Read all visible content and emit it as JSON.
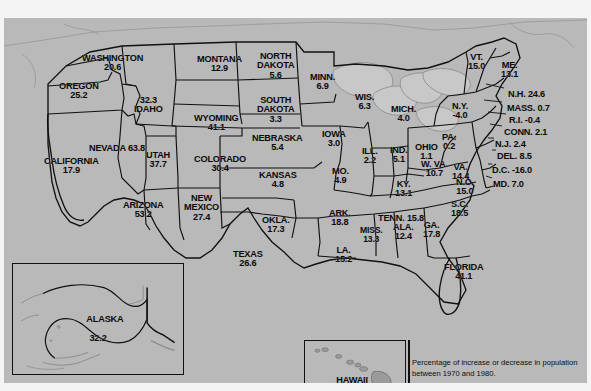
{
  "figure": {
    "kind": "choropleth-map",
    "region": "United States",
    "caption": "Percentage of increase or decrease in population between 1970 and 1980.",
    "background_color": "#b9b9b9",
    "land_color": "#b9b9b9",
    "water_color": "#c9c9c9",
    "border_color": "#111111",
    "text_color": "#0b0b0b"
  },
  "insets": {
    "alaska": {
      "name": "ALASKA",
      "value": "32.2"
    },
    "hawaii": {
      "name": "HAWAII",
      "value": "25.3"
    }
  },
  "chart_data": {
    "type": "map",
    "title": "",
    "subtitle": "Percentage of increase or decrease in population between 1970 and 1980.",
    "unit": "percent",
    "value_label": "Percent change in population, 1970-1980",
    "categories": [
      "WASHINGTON",
      "OREGON",
      "IDAHO",
      "MONTANA",
      "WYOMING",
      "NEVADA",
      "CALIFORNIA",
      "UTAH",
      "COLORADO",
      "ARIZONA",
      "NEW MEXICO",
      "NORTH DAKOTA",
      "SOUTH DAKOTA",
      "NEBRASKA",
      "KANSAS",
      "OKLA.",
      "TEXAS",
      "MINN.",
      "IOWA",
      "MO.",
      "ARK.",
      "LA.",
      "WIS.",
      "ILL.",
      "MISS.",
      "MICH.",
      "IND.",
      "OHIO",
      "KY.",
      "TENN.",
      "ALA.",
      "GA.",
      "FLORIDA",
      "S.C.",
      "N.C.",
      "VA.",
      "W. VA.",
      "MD.",
      "D.C.",
      "DEL.",
      "PA.",
      "N.J.",
      "N.Y.",
      "CONN.",
      "R.I.",
      "MASS.",
      "VT.",
      "N.H.",
      "ME.",
      "ALASKA",
      "HAWAII"
    ],
    "values": [
      20.6,
      25.2,
      32.3,
      12.9,
      41.1,
      63.8,
      17.9,
      37.7,
      30.4,
      53.2,
      27.4,
      5.6,
      3.3,
      5.4,
      4.8,
      17.3,
      26.6,
      6.9,
      3.0,
      4.9,
      18.8,
      15.2,
      6.3,
      2.2,
      13.3,
      4.0,
      5.1,
      1.1,
      13.1,
      15.8,
      12.4,
      17.8,
      41.1,
      18.5,
      15.0,
      14.4,
      10.7,
      7.0,
      -16.0,
      8.5,
      0.2,
      2.4,
      -4.0,
      2.1,
      -0.4,
      0.7,
      15.0,
      24.6,
      13.1,
      32.2,
      25.3
    ]
  },
  "states": [
    {
      "name": "WASHINGTON",
      "value": "20.6",
      "layout": "stack",
      "x": 78,
      "y": 36,
      "size": "s11"
    },
    {
      "name": "OREGON",
      "value": "25.2",
      "layout": "stack",
      "x": 55,
      "y": 64,
      "size": "s11"
    },
    {
      "name": "IDAHO",
      "value": "32.3",
      "layout": "value-above",
      "x": 130,
      "y": 78,
      "size": "s11"
    },
    {
      "name": "MONTANA",
      "value": "12.9",
      "layout": "stack",
      "x": 193,
      "y": 37,
      "size": "s11"
    },
    {
      "name": "WYOMING",
      "value": "41.1",
      "layout": "stack",
      "x": 190,
      "y": 96,
      "size": "s11"
    },
    {
      "name": "NEVADA",
      "value": "63.8",
      "layout": "inline-right",
      "x": 85,
      "y": 126,
      "size": "s11"
    },
    {
      "name": "CALIFORNIA",
      "value": "17.9",
      "layout": "stack",
      "x": 40,
      "y": 139,
      "size": "s11"
    },
    {
      "name": "UTAH",
      "value": "37.7",
      "layout": "stack",
      "x": 142,
      "y": 133,
      "size": "s11"
    },
    {
      "name": "COLORADO",
      "value": "30.4",
      "layout": "stack",
      "x": 190,
      "y": 137,
      "size": "s11"
    },
    {
      "name": "ARIZONA",
      "value": "53.2",
      "layout": "stack",
      "x": 119,
      "y": 183,
      "size": "s11"
    },
    {
      "name": "NEW\nMEXICO",
      "value": "27.4",
      "layout": "stack",
      "x": 180,
      "y": 176,
      "size": "s11"
    },
    {
      "name": "NORTH\nDAKOTA",
      "value": "5.6",
      "layout": "stack",
      "x": 253,
      "y": 34,
      "size": "s11"
    },
    {
      "name": "SOUTH\nDAKOTA",
      "value": "3.3",
      "layout": "stack",
      "x": 253,
      "y": 78,
      "size": "s11"
    },
    {
      "name": "NEBRASKA",
      "value": "5.4",
      "layout": "stack",
      "x": 248,
      "y": 116,
      "size": "s11"
    },
    {
      "name": "KANSAS",
      "value": "4.8",
      "layout": "stack",
      "x": 255,
      "y": 153,
      "size": "s11"
    },
    {
      "name": "OKLA.",
      "value": "17.3",
      "layout": "stack",
      "x": 258,
      "y": 198,
      "size": "s11"
    },
    {
      "name": "TEXAS",
      "value": "26.6",
      "layout": "stack",
      "x": 229,
      "y": 232,
      "size": "s11"
    },
    {
      "name": "MINN.",
      "value": "6.9",
      "layout": "stack",
      "x": 306,
      "y": 55,
      "size": "s11"
    },
    {
      "name": "IOWA",
      "value": "3.0",
      "layout": "stack",
      "x": 318,
      "y": 112,
      "size": "s11"
    },
    {
      "name": "MO.",
      "value": "4.9",
      "layout": "stack",
      "x": 328,
      "y": 149,
      "size": "s11"
    },
    {
      "name": "ARK.",
      "value": "18.8",
      "layout": "stack",
      "x": 325,
      "y": 191,
      "size": "s11"
    },
    {
      "name": "LA.",
      "value": "15.2",
      "layout": "stack",
      "x": 331,
      "y": 228,
      "size": "s11"
    },
    {
      "name": "WIS.",
      "value": "6.3",
      "layout": "stack",
      "x": 351,
      "y": 75,
      "size": "s11"
    },
    {
      "name": "ILL.",
      "value": "2.2",
      "layout": "stack",
      "x": 358,
      "y": 129,
      "size": "s11"
    },
    {
      "name": "MISS.",
      "value": "13.3",
      "layout": "stack",
      "x": 356,
      "y": 208,
      "size": "s10"
    },
    {
      "name": "MICH.",
      "value": "4.0",
      "layout": "stack",
      "x": 387,
      "y": 87,
      "size": "s11"
    },
    {
      "name": "IND.",
      "value": "5.1",
      "layout": "stack",
      "x": 386,
      "y": 128,
      "size": "s11"
    },
    {
      "name": "OHIO",
      "value": "1.1",
      "layout": "stack",
      "x": 411,
      "y": 125,
      "size": "s11"
    },
    {
      "name": "KY.",
      "value": "13.1",
      "layout": "stack",
      "x": 391,
      "y": 162,
      "size": "s11"
    },
    {
      "name": "TENN.",
      "value": "15.8",
      "layout": "inline-right",
      "x": 374,
      "y": 196,
      "size": "s11"
    },
    {
      "name": "ALA.",
      "value": "12.4",
      "layout": "stack",
      "x": 389,
      "y": 205,
      "size": "s11"
    },
    {
      "name": "GA.",
      "value": "17.8",
      "layout": "stack",
      "x": 419,
      "y": 203,
      "size": "s11"
    },
    {
      "name": "FLORIDA",
      "value": "41.1",
      "layout": "stack",
      "x": 440,
      "y": 245,
      "size": "s11"
    },
    {
      "name": "S.C.",
      "value": "18.5",
      "layout": "stack",
      "x": 447,
      "y": 182,
      "size": "s11"
    },
    {
      "name": "N.C.",
      "value": "15.0",
      "layout": "stack",
      "x": 452,
      "y": 160,
      "size": "s11"
    },
    {
      "name": "VA.",
      "value": "14.4",
      "layout": "stack",
      "x": 448,
      "y": 145,
      "size": "s11"
    },
    {
      "name": "W. VA.",
      "value": "10.7",
      "layout": "stack",
      "x": 417,
      "y": 142,
      "size": "s11"
    },
    {
      "name": "MD.",
      "value": "7.0",
      "layout": "inline-right",
      "x": 489,
      "y": 162,
      "size": "s11"
    },
    {
      "name": "D.C.",
      "value": "-16.0",
      "layout": "inline-right",
      "x": 488,
      "y": 148,
      "size": "s11"
    },
    {
      "name": "DEL.",
      "value": "8.5",
      "layout": "inline-right",
      "x": 493,
      "y": 134,
      "size": "s11"
    },
    {
      "name": "PA.",
      "value": "0.2",
      "layout": "stack",
      "x": 438,
      "y": 115,
      "size": "s11"
    },
    {
      "name": "N.J.",
      "value": "2.4",
      "layout": "inline-right",
      "x": 491,
      "y": 122,
      "size": "s11"
    },
    {
      "name": "N.Y.",
      "value": "-4.0",
      "layout": "stack",
      "x": 448,
      "y": 84,
      "size": "s11"
    },
    {
      "name": "CONN.",
      "value": "2.1",
      "layout": "inline-right",
      "x": 500,
      "y": 110,
      "size": "s11"
    },
    {
      "name": "R.I.",
      "value": "-0.4",
      "layout": "inline-right",
      "x": 505,
      "y": 98,
      "size": "s11"
    },
    {
      "name": "MASS.",
      "value": "0.7",
      "layout": "inline-right",
      "x": 503,
      "y": 86,
      "size": "s11"
    },
    {
      "name": "VT.",
      "value": "15.0",
      "layout": "stack",
      "x": 464,
      "y": 35,
      "size": "s11"
    },
    {
      "name": "N.H.",
      "value": "24.6",
      "layout": "inline-right",
      "x": 504,
      "y": 72,
      "size": "s11"
    },
    {
      "name": "ME.",
      "value": "13.1",
      "layout": "stack",
      "x": 497,
      "y": 43,
      "size": "s11"
    }
  ]
}
